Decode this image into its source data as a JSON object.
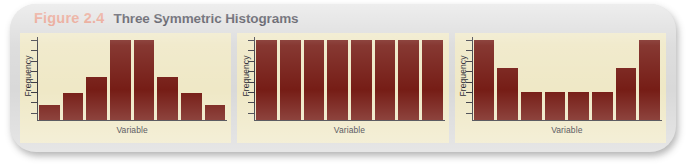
{
  "figure": {
    "number": "Figure 2.4",
    "title": "Three Symmetric Histograms"
  },
  "colors": {
    "bar": "#761d16",
    "panel_background": "#efe8c6",
    "card_background": "#d9d9d9",
    "figure_number": "#e2856d",
    "title_text": "#1b1b2b",
    "axis": "#3a3a42"
  },
  "chart_data": [
    {
      "type": "bar",
      "title": "Symmetric bell-shaped histogram",
      "xlabel": "Variable",
      "ylabel": "Frequency",
      "categories": [
        "1",
        "2",
        "3",
        "4",
        "5",
        "6",
        "7",
        "8"
      ],
      "values": [
        18,
        32,
        52,
        97,
        97,
        52,
        32,
        18
      ],
      "ylim": [
        0,
        100
      ],
      "grid": false,
      "legend": "none",
      "axis_ticks": 8,
      "tick_labels": []
    },
    {
      "type": "bar",
      "title": "Uniform (rectangular) histogram",
      "xlabel": "Variable",
      "ylabel": "Frequency",
      "categories": [
        "1",
        "2",
        "3",
        "4",
        "5",
        "6",
        "7",
        "8"
      ],
      "values": [
        97,
        97,
        97,
        97,
        97,
        97,
        97,
        97
      ],
      "ylim": [
        0,
        100
      ],
      "grid": false,
      "legend": "none",
      "axis_ticks": 8,
      "tick_labels": []
    },
    {
      "type": "bar",
      "title": "U-shaped (bimodal) histogram",
      "xlabel": "Variable",
      "ylabel": "Frequency",
      "categories": [
        "1",
        "2",
        "3",
        "4",
        "5",
        "6",
        "7",
        "8"
      ],
      "values": [
        97,
        63,
        34,
        34,
        34,
        34,
        63,
        97
      ],
      "ylim": [
        0,
        100
      ],
      "grid": false,
      "legend": "none",
      "axis_ticks": 8,
      "tick_labels": []
    }
  ]
}
